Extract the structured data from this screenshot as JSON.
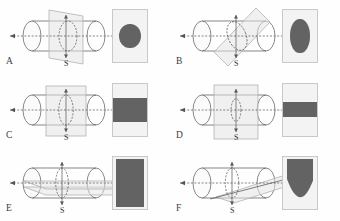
{
  "figure": {
    "background": "#fefefe",
    "width": 340,
    "height": 221,
    "fill_color": "#636363",
    "box_fill": "#f3f3f3",
    "box_border": "#c9c9c9",
    "line_color": "#555555",
    "plane_fill": "#e3e3e3"
  },
  "labels": {
    "axis_line": "L",
    "plane_marker": "S"
  },
  "panels": [
    {
      "letter": "A",
      "plane_orientation": "vertical, perpendicular to axis",
      "axis_label": "L",
      "plane_label": "S",
      "result": {
        "shape": "circle",
        "description": "circle",
        "width_pct": 62,
        "height_pct": 46
      }
    },
    {
      "letter": "B",
      "plane_orientation": "tilted oblique to axis",
      "axis_label": "L",
      "plane_label": "S",
      "result": {
        "shape": "ellipse",
        "description": "ellipse",
        "width_pct": 56,
        "height_pct": 64
      }
    },
    {
      "letter": "C",
      "plane_orientation": "vertical, parallel to axis, off-center",
      "axis_label": "L",
      "plane_label": "S",
      "result": {
        "shape": "rectangle",
        "description": "wide rectangle",
        "width_pct": 100,
        "height_pct": 46
      }
    },
    {
      "letter": "D",
      "plane_orientation": "vertical, parallel to axis, near edge",
      "axis_label": "L",
      "plane_label": "S",
      "result": {
        "shape": "rectangle",
        "description": "narrow band rectangle",
        "width_pct": 100,
        "height_pct": 29
      }
    },
    {
      "letter": "E",
      "plane_orientation": "horizontal, containing the axis",
      "axis_label": "L",
      "plane_label": "S",
      "result": {
        "shape": "rectangle",
        "description": "tall rectangle filling box",
        "width_pct": 80,
        "height_pct": 92
      }
    },
    {
      "letter": "F",
      "plane_orientation": "tilted, oblique through the side",
      "axis_label": "L",
      "plane_label": "S",
      "result": {
        "shape": "parabola",
        "description": "parabolic U-shaped section",
        "width_pct": 78,
        "height_pct": 92
      }
    }
  ]
}
